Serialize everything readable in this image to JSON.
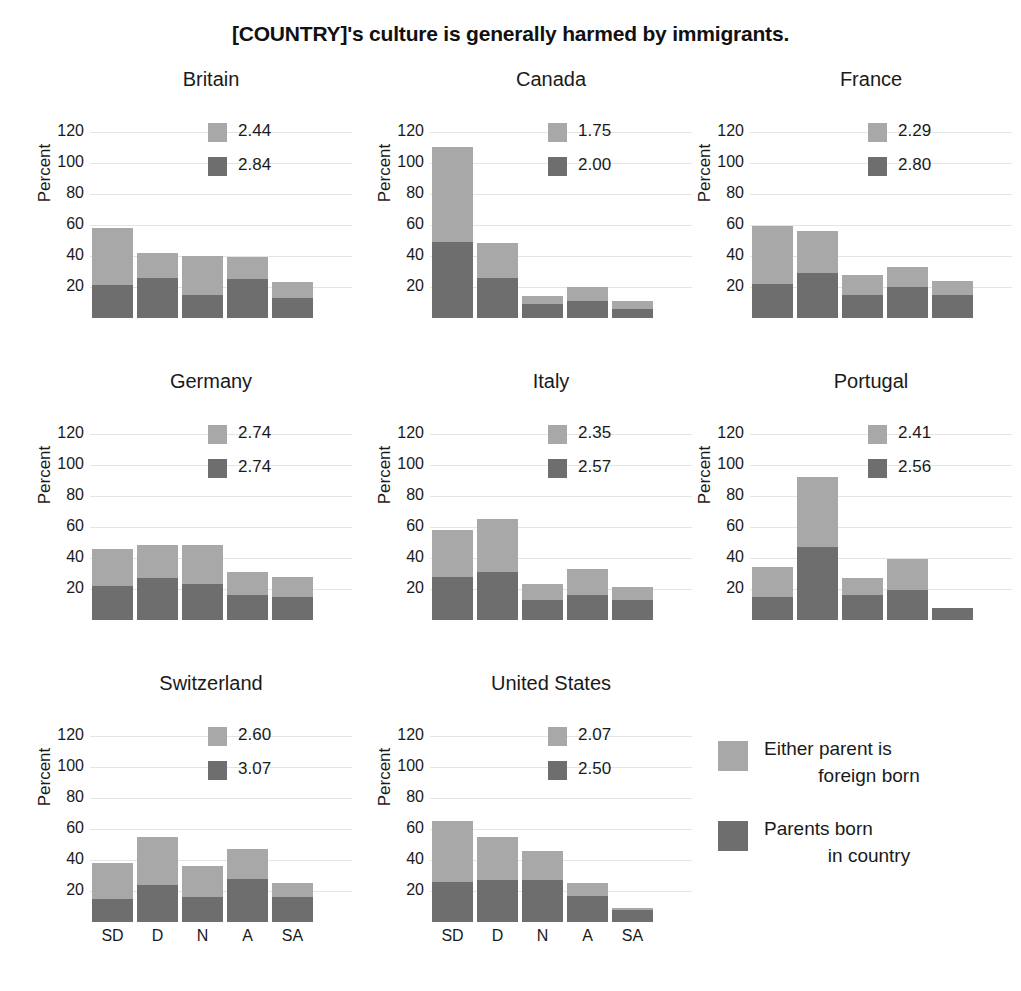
{
  "chart_data": {
    "type": "bar",
    "title": "[COUNTRY]'s culture is generally harmed by immigrants.",
    "subtype": "stacked bar, small multiples (3x3 faceted by country)",
    "xlabel": "",
    "ylabel": "Percent",
    "ylim": [
      0,
      130
    ],
    "yticks": [
      20,
      40,
      60,
      80,
      100,
      120
    ],
    "categories": [
      "SD",
      "D",
      "N",
      "A",
      "SA"
    ],
    "grid": true,
    "legend_position": "bottom-right",
    "series": [
      {
        "name": "Either parent is foreign born",
        "color": "#a8a8a8"
      },
      {
        "name": "Parents born in country",
        "color": "#6e6e6e"
      }
    ],
    "panels": [
      {
        "country": "Britain",
        "mean_foreign": "2.44",
        "mean_native": "2.84",
        "foreign_born": [
          58,
          42,
          40,
          39,
          23
        ],
        "native_born": [
          21,
          26,
          15,
          25,
          13
        ]
      },
      {
        "country": "Canada",
        "mean_foreign": "1.75",
        "mean_native": "2.00",
        "foreign_born": [
          110,
          48,
          14,
          20,
          11
        ],
        "native_born": [
          49,
          26,
          9,
          11,
          6
        ]
      },
      {
        "country": "France",
        "mean_foreign": "2.29",
        "mean_native": "2.80",
        "foreign_born": [
          59,
          56,
          28,
          33,
          24
        ],
        "native_born": [
          22,
          29,
          15,
          20,
          15
        ]
      },
      {
        "country": "Germany",
        "mean_foreign": "2.74",
        "mean_native": "2.74",
        "foreign_born": [
          46,
          48,
          48,
          31,
          28
        ],
        "native_born": [
          22,
          27,
          23,
          16,
          15
        ]
      },
      {
        "country": "Italy",
        "mean_foreign": "2.35",
        "mean_native": "2.57",
        "foreign_born": [
          58,
          65,
          23,
          33,
          21
        ],
        "native_born": [
          28,
          31,
          13,
          16,
          13
        ]
      },
      {
        "country": "Portugal",
        "mean_foreign": "2.41",
        "mean_native": "2.56",
        "foreign_born": [
          34,
          92,
          27,
          39,
          8
        ],
        "native_born": [
          15,
          47,
          16,
          19,
          8
        ]
      },
      {
        "country": "Switzerland",
        "mean_foreign": "2.60",
        "mean_native": "3.07",
        "foreign_born": [
          38,
          55,
          36,
          47,
          25
        ],
        "native_born": [
          15,
          24,
          16,
          28,
          16
        ]
      },
      {
        "country": "United States",
        "mean_foreign": "2.07",
        "mean_native": "2.50",
        "foreign_born": [
          65,
          55,
          46,
          25,
          9
        ],
        "native_born": [
          26,
          27,
          27,
          17,
          8
        ]
      }
    ]
  },
  "legend": {
    "light": {
      "line1": "Either parent is",
      "line2": "foreign born"
    },
    "dark": {
      "line1": "Parents born",
      "line2": "in country"
    }
  },
  "axis": {
    "ylabel": "Percent",
    "yticks": [
      "120",
      "100",
      "80",
      "60",
      "40",
      "20"
    ],
    "xticks": [
      "SD",
      "D",
      "N",
      "A",
      "SA"
    ]
  }
}
